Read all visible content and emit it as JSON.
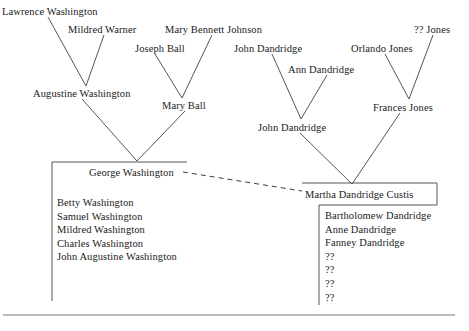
{
  "diagram": {
    "line_color": "#555555",
    "text_color": "#1a1a1a"
  },
  "generation1": [
    {
      "id": "lawrence-washington",
      "label": "Lawrence Washington",
      "x": 2,
      "y": 6
    },
    {
      "id": "mildred-warner",
      "label": "Mildred Warner",
      "x": 68,
      "y": 24
    },
    {
      "id": "mary-bennett-johnson",
      "label": "Mary Bennett Johnson",
      "x": 165,
      "y": 24
    },
    {
      "id": "qq-jones",
      "label": "?? Jones",
      "x": 414,
      "y": 24
    },
    {
      "id": "joseph-ball",
      "label": "Joseph Ball",
      "x": 135,
      "y": 43
    },
    {
      "id": "john-dandridge-sr",
      "label": "John Dandridge",
      "x": 234,
      "y": 43
    },
    {
      "id": "orlando-jones",
      "label": "Orlando Jones",
      "x": 351,
      "y": 43
    }
  ],
  "generation2": [
    {
      "id": "augustine-washington",
      "label": "Augustine Washington",
      "x": 33,
      "y": 88
    },
    {
      "id": "ann-dandridge",
      "label": "Ann Dandridge",
      "x": 288,
      "y": 64
    },
    {
      "id": "mary-ball",
      "label": "Mary Ball",
      "x": 162,
      "y": 100
    },
    {
      "id": "frances-jones",
      "label": "Frances Jones",
      "x": 373,
      "y": 102
    }
  ],
  "generation3": [
    {
      "id": "john-dandridge-jr",
      "label": "John Dandridge",
      "x": 258,
      "y": 122
    }
  ],
  "couple": {
    "husband": {
      "id": "george-washington",
      "label": "George Washington",
      "x": 89,
      "y": 167
    },
    "wife": {
      "id": "martha-dandridge-custis",
      "label": "Martha Dandridge Custis",
      "x": 305,
      "y": 189
    }
  },
  "washington_siblings": {
    "x": 57,
    "y": 196,
    "items": [
      "Betty Washington",
      "Samuel Washington",
      "Mildred Washington",
      "Charles Washington",
      "John Augustine Washington"
    ]
  },
  "dandridge_siblings": {
    "x": 325,
    "y": 209,
    "items": [
      "Bartholomew Dandridge",
      "Anne Dandridge",
      "Fanney Dandridge",
      "??",
      "??",
      "??",
      "??"
    ]
  },
  "connectors": {
    "v_joins": [
      {
        "name": "augustine-parents-join",
        "left_x": 48,
        "left_y": 17,
        "apex_x": 86,
        "apex_y": 86,
        "right_x": 104,
        "right_y": 35
      },
      {
        "name": "mary-ball-parents-join",
        "left_x": 155,
        "left_y": 54,
        "apex_x": 182,
        "apex_y": 98,
        "right_x": 212,
        "right_y": 35
      },
      {
        "name": "john-dandridge-parents-join",
        "left_x": 272,
        "left_y": 54,
        "apex_x": 301,
        "apex_y": 119,
        "right_x": 327,
        "right_y": 75
      },
      {
        "name": "frances-jones-parents-join",
        "left_x": 385,
        "left_y": 54,
        "apex_x": 409,
        "apex_y": 99,
        "right_x": 433,
        "right_y": 35
      },
      {
        "name": "george-washington-parents-join",
        "left_x": 82,
        "left_y": 99,
        "apex_x": 137,
        "apex_y": 161,
        "right_x": 185,
        "right_y": 111
      },
      {
        "name": "martha-parents-join",
        "left_x": 300,
        "left_y": 133,
        "apex_x": 352,
        "apex_y": 184,
        "right_x": 400,
        "right_y": 113
      }
    ],
    "marriage_line": {
      "name": "marriage-dashed-line",
      "x1": 183,
      "y1": 172,
      "x2": 302,
      "y2": 191
    }
  },
  "boxes": {
    "washington_box": {
      "name": "washington-family-box",
      "x": 52,
      "y": 162,
      "w": 135,
      "h": 139
    },
    "martha_box": {
      "name": "martha-box",
      "x": 302,
      "y": 183,
      "w": 135,
      "h": 22
    },
    "dandridge_box": {
      "name": "dandridge-children-box",
      "x": 319,
      "y": 205,
      "w": 120,
      "h": 100
    },
    "baseline": {
      "name": "bottom-rule",
      "x1": 3,
      "y1": 315,
      "x2": 455,
      "y2": 315
    }
  }
}
